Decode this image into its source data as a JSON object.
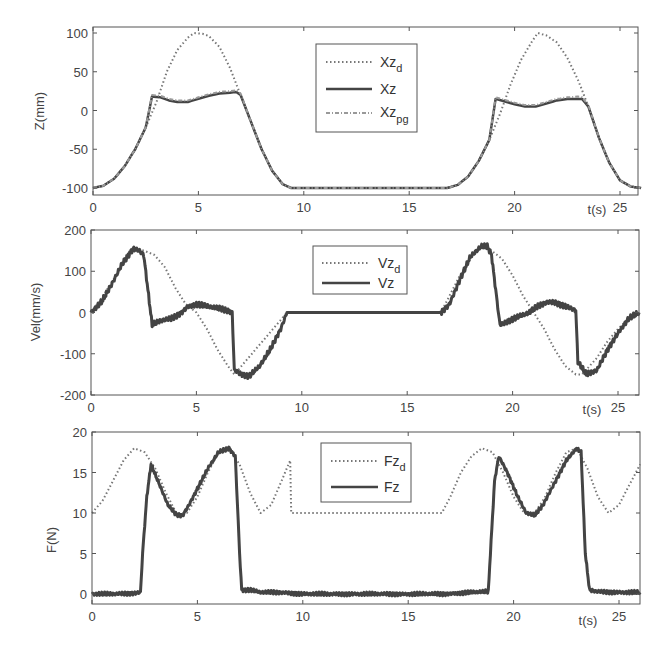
{
  "chart_data": [
    {
      "type": "line",
      "title": "",
      "xlabel": "t(s)",
      "ylabel": "Z(mm)",
      "xlim": [
        0,
        26
      ],
      "ylim": [
        -110,
        105
      ],
      "xticks": [
        0,
        5,
        10,
        15,
        20,
        25
      ],
      "yticks": [
        -100,
        -50,
        0,
        50,
        100
      ],
      "grid": false,
      "legend_position": "upper center",
      "legend": [
        {
          "base": "Xz",
          "sub": "d",
          "style": "dotted"
        },
        {
          "base": "Xz",
          "sub": "",
          "style": "solid"
        },
        {
          "base": "Xz",
          "sub": "pg",
          "style": "dash-dot"
        }
      ],
      "series": [
        {
          "name": "Xz_d",
          "style": "dotted",
          "x": [
            0,
            0.5,
            1,
            1.5,
            2,
            2.5,
            3,
            3.5,
            4,
            4.5,
            4.8,
            5.2,
            5.5,
            6,
            6.5,
            7,
            7.5,
            8,
            8.5,
            9,
            9.4,
            12,
            15,
            16.8,
            17.3,
            17.8,
            18.3,
            18.8,
            19.3,
            19.8,
            20.3,
            20.8,
            21.1,
            21.5,
            22,
            22.5,
            23,
            23.5,
            24,
            24.5,
            25,
            25.5,
            26
          ],
          "y": [
            -100,
            -97,
            -88,
            -72,
            -50,
            -22,
            10,
            50,
            78,
            94,
            100,
            99,
            96,
            82,
            55,
            20,
            -15,
            -50,
            -78,
            -95,
            -100,
            -100,
            -100,
            -100,
            -96,
            -85,
            -65,
            -38,
            -5,
            33,
            65,
            88,
            100,
            97,
            88,
            68,
            40,
            5,
            -35,
            -68,
            -90,
            -98,
            -100
          ]
        },
        {
          "name": "Xz",
          "style": "solid",
          "x": [
            0,
            0.5,
            1,
            1.5,
            2,
            2.5,
            2.8,
            3.2,
            3.6,
            4,
            4.5,
            5,
            5.5,
            6,
            6.5,
            6.8,
            7,
            7.5,
            8,
            8.5,
            9,
            9.4,
            12,
            15,
            16.8,
            17.3,
            17.8,
            18.3,
            18.8,
            19.1,
            19.5,
            20,
            20.5,
            21,
            21.5,
            22,
            22.5,
            23,
            23.2,
            23.5,
            24,
            24.5,
            25,
            25.5,
            26
          ],
          "y": [
            -100,
            -97,
            -88,
            -72,
            -50,
            -22,
            18,
            17,
            13,
            11,
            11,
            15,
            19,
            22,
            23,
            24,
            20,
            -15,
            -50,
            -78,
            -95,
            -100,
            -100,
            -100,
            -100,
            -96,
            -85,
            -65,
            -38,
            15,
            12,
            8,
            5,
            5,
            9,
            13,
            15,
            15,
            15,
            5,
            -35,
            -68,
            -90,
            -98,
            -100
          ]
        },
        {
          "name": "Xz_pg",
          "style": "dash-dot",
          "x": [
            0,
            0.5,
            1,
            1.5,
            2,
            2.5,
            2.8,
            3.2,
            3.6,
            4,
            4.5,
            5,
            5.5,
            6,
            6.5,
            6.8,
            7,
            7.5,
            8,
            8.5,
            9,
            9.4,
            12,
            15,
            16.8,
            17.3,
            17.8,
            18.3,
            18.8,
            19.1,
            19.5,
            20,
            20.5,
            21,
            21.5,
            22,
            22.5,
            23,
            23.2,
            23.5,
            24,
            24.5,
            25,
            25.5,
            26
          ],
          "y": [
            -100,
            -97,
            -88,
            -72,
            -50,
            -22,
            20,
            19,
            15,
            13,
            13,
            17,
            21,
            24,
            25,
            26,
            22,
            -15,
            -50,
            -78,
            -95,
            -100,
            -100,
            -100,
            -100,
            -96,
            -85,
            -65,
            -38,
            17,
            14,
            10,
            7,
            7,
            11,
            15,
            17,
            18,
            17,
            7,
            -35,
            -68,
            -90,
            -98,
            -100
          ]
        }
      ]
    },
    {
      "type": "line",
      "title": "",
      "xlabel": "t(s)",
      "ylabel": "Vel(mm/s)",
      "xlim": [
        0,
        26
      ],
      "ylim": [
        -200,
        200
      ],
      "xticks": [
        0,
        5,
        10,
        15,
        20,
        25
      ],
      "yticks": [
        -200,
        -100,
        0,
        100,
        200
      ],
      "grid": false,
      "legend_position": "upper center",
      "legend": [
        {
          "base": "Vz",
          "sub": "d",
          "style": "dotted"
        },
        {
          "base": "Vz",
          "sub": "",
          "style": "solid"
        }
      ],
      "series": [
        {
          "name": "Vz_d",
          "style": "dotted",
          "x": [
            0,
            0.5,
            1,
            1.5,
            2,
            2.5,
            3,
            3.5,
            4,
            4.5,
            5,
            5.5,
            6,
            6.5,
            6.8,
            9.3,
            16.6,
            17,
            17.5,
            18,
            18.5,
            19,
            19.5,
            20,
            20.5,
            21,
            21.5,
            22,
            22.5,
            23,
            23.3,
            24,
            24.5,
            25,
            25.5,
            26
          ],
          "y": [
            0,
            35,
            75,
            115,
            150,
            150,
            140,
            110,
            60,
            20,
            0,
            -40,
            -90,
            -130,
            -150,
            0,
            0,
            40,
            90,
            130,
            160,
            150,
            130,
            90,
            40,
            0,
            -40,
            -90,
            -130,
            -150,
            -150,
            -110,
            -70,
            -40,
            -15,
            0
          ]
        },
        {
          "name": "Vz",
          "style": "solid-noisy",
          "x": [
            0,
            0.5,
            1,
            1.5,
            2,
            2.3,
            2.5,
            2.9,
            3.3,
            3.8,
            4.3,
            4.6,
            5,
            5.5,
            6,
            6.5,
            6.7,
            6.8,
            7.2,
            7.5,
            8,
            8.5,
            9,
            9.3,
            16.6,
            17,
            17.5,
            18,
            18.5,
            18.8,
            19,
            19.4,
            19.8,
            20.3,
            20.8,
            21.2,
            21.6,
            22,
            22.5,
            23,
            23.1,
            23.5,
            24,
            24.5,
            25,
            25.5,
            26
          ],
          "y": [
            0,
            25,
            70,
            120,
            155,
            150,
            140,
            -30,
            -20,
            -15,
            0,
            15,
            20,
            15,
            10,
            5,
            0,
            -140,
            -150,
            -155,
            -130,
            -90,
            -40,
            0,
            0,
            20,
            80,
            135,
            160,
            160,
            140,
            -30,
            -20,
            -10,
            0,
            15,
            25,
            25,
            15,
            5,
            -120,
            -150,
            -140,
            -90,
            -50,
            -15,
            0
          ]
        }
      ]
    },
    {
      "type": "line",
      "title": "",
      "xlabel": "t(s)",
      "ylabel": "F(N)",
      "xlim": [
        0,
        26
      ],
      "ylim": [
        -1,
        20
      ],
      "xticks": [
        0,
        5,
        10,
        15,
        20,
        25
      ],
      "yticks": [
        0,
        5,
        10,
        15,
        20
      ],
      "grid": false,
      "legend_position": "upper center",
      "legend": [
        {
          "base": "Fz",
          "sub": "d",
          "style": "dotted"
        },
        {
          "base": "Fz",
          "sub": "",
          "style": "solid"
        }
      ],
      "series": [
        {
          "name": "Fz_d",
          "style": "dotted",
          "x": [
            0,
            0.5,
            1,
            1.5,
            2,
            2.5,
            3,
            3.5,
            4,
            4.5,
            5,
            5.5,
            6,
            6.5,
            7,
            7.5,
            8,
            8.5,
            9,
            9.4,
            9.45,
            12,
            15,
            16.6,
            17,
            17.5,
            18,
            18.5,
            19,
            19.5,
            20,
            20.5,
            21,
            21.5,
            22,
            22.5,
            23,
            23.5,
            24,
            24.5,
            25,
            25.5,
            26
          ],
          "y": [
            10,
            11.5,
            14,
            16.5,
            18,
            17.5,
            15.5,
            12.5,
            10,
            10,
            12,
            15,
            17.5,
            18,
            16,
            12.5,
            10,
            11,
            14,
            16.5,
            10,
            10,
            10,
            10,
            12,
            15,
            17,
            18,
            17.5,
            15,
            12,
            10,
            10,
            12,
            15,
            17.5,
            18,
            15.5,
            12,
            10,
            11,
            13.5,
            16
          ]
        },
        {
          "name": "Fz",
          "style": "solid-noisy",
          "x": [
            0,
            1,
            2,
            2.3,
            2.4,
            2.6,
            2.8,
            3.2,
            3.6,
            4,
            4.3,
            4.6,
            5,
            5.5,
            6,
            6.5,
            6.8,
            7,
            7.1,
            7.5,
            8,
            9,
            10,
            12,
            15,
            16.6,
            18,
            18.8,
            18.9,
            19.1,
            19.3,
            19.7,
            20.2,
            20.6,
            21,
            21.4,
            22,
            22.5,
            23,
            23.2,
            23.4,
            23.6,
            24,
            25,
            26
          ],
          "y": [
            0,
            0,
            0.1,
            0.2,
            5,
            12,
            16,
            13.5,
            11,
            9.8,
            9.7,
            11,
            13,
            15.5,
            17.5,
            18,
            17,
            5,
            0.5,
            0.5,
            0.2,
            0.2,
            0,
            0,
            0,
            0,
            0.2,
            0.3,
            5,
            14,
            17,
            15,
            12,
            10,
            9.7,
            11,
            14,
            16.5,
            18,
            17.5,
            5,
            0.5,
            0.3,
            0.2,
            0.2
          ]
        }
      ]
    }
  ],
  "panels": [
    {
      "ylabel": "Z(mm)",
      "xlabel": "t(s)",
      "xticks": [
        "0",
        "5",
        "10",
        "15",
        "20",
        "25"
      ],
      "yticks": [
        "100",
        "50",
        "0",
        "-50",
        "-100"
      ],
      "legend": [
        {
          "base": "Xz",
          "sub": "d"
        },
        {
          "base": "Xz",
          "sub": ""
        },
        {
          "base": "Xz",
          "sub": "pg"
        }
      ]
    },
    {
      "ylabel": "Vel(mm/s)",
      "xlabel": "t(s)",
      "xticks": [
        "0",
        "5",
        "10",
        "15",
        "20",
        "25"
      ],
      "yticks": [
        "200",
        "100",
        "0",
        "-100",
        "-200"
      ],
      "legend": [
        {
          "base": "Vz",
          "sub": "d"
        },
        {
          "base": "Vz",
          "sub": ""
        }
      ]
    },
    {
      "ylabel": "F(N)",
      "xlabel": "t(s)",
      "xticks": [
        "0",
        "5",
        "10",
        "15",
        "20",
        "25"
      ],
      "yticks": [
        "20",
        "15",
        "10",
        "5",
        "0"
      ],
      "legend": [
        {
          "base": "Fz",
          "sub": "d"
        },
        {
          "base": "Fz",
          "sub": ""
        }
      ]
    }
  ],
  "colors": {
    "axis": "#555555",
    "desired": "#777777",
    "measured": "#444444",
    "pg": "#999999"
  }
}
